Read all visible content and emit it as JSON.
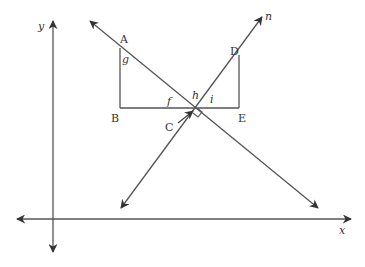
{
  "diagram": {
    "type": "geometry",
    "axes": {
      "x_label": "x",
      "y_label": "y"
    },
    "lines": {
      "transversal_label": "n"
    },
    "points": {
      "A": "A",
      "B": "B",
      "C": "C",
      "D": "D",
      "E": "E"
    },
    "angles": {
      "f": "f",
      "g": "g",
      "h": "h",
      "i": "i"
    },
    "colors": {
      "stroke": "#444444",
      "text": "#333333",
      "background": "#ffffff"
    }
  }
}
